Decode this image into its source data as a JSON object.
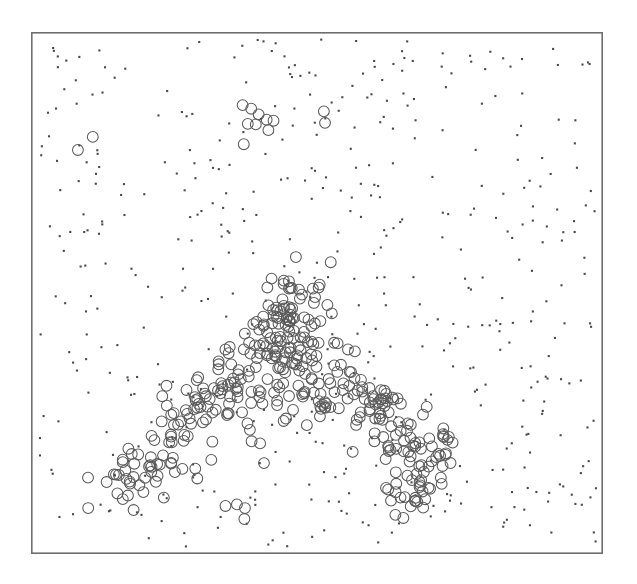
{
  "figure": {
    "background_color": "#ffffff",
    "width": 637,
    "height": 584
  },
  "plot": {
    "frame": {
      "left": 31,
      "top": 32,
      "width": 572,
      "height": 522,
      "stroke_color": "#6e6e6e",
      "stroke_width": 1.6
    },
    "title": "",
    "xlabel": "",
    "ylabel": "",
    "x_tick_labels": [],
    "y_tick_labels": [],
    "legend": null,
    "grid": false
  },
  "chart_data": {
    "type": "scatter",
    "title": "",
    "subtitle": "",
    "xlabel": "",
    "ylabel": "",
    "grid": false,
    "legend_position": "none",
    "xlim": [
      0,
      1
    ],
    "ylim": [
      0,
      1
    ],
    "axis_ticks_visible": false,
    "tick_labels_visible": false,
    "series": [
      {
        "name": "noise",
        "marker": "filled-dot",
        "marker_size_px": 2.1,
        "color": "#4a4a4a",
        "count": 520,
        "distribution": "uniform-random over full panel",
        "seed": 20240517
      },
      {
        "name": "cluster",
        "marker": "open-circle",
        "marker_radius_px": 5.4,
        "stroke_color": "#5a5a5a",
        "stroke_width_px": 1.05,
        "count": 430,
        "distribution": "triangular ridge / mountain-shaped band in lower-centre plus sparse outliers",
        "seed": 987654,
        "ridge_nodes": [
          {
            "x": 0.455,
            "y": 0.515,
            "spread_x": 0.045,
            "spread_y": 0.045,
            "weight": 0.1
          },
          {
            "x": 0.43,
            "y": 0.58,
            "spread_x": 0.055,
            "spread_y": 0.05,
            "weight": 0.12
          },
          {
            "x": 0.48,
            "y": 0.635,
            "spread_x": 0.06,
            "spread_y": 0.05,
            "weight": 0.12
          },
          {
            "x": 0.37,
            "y": 0.65,
            "spread_x": 0.05,
            "spread_y": 0.045,
            "weight": 0.1
          },
          {
            "x": 0.3,
            "y": 0.715,
            "spread_x": 0.055,
            "spread_y": 0.045,
            "weight": 0.11
          },
          {
            "x": 0.225,
            "y": 0.79,
            "spread_x": 0.055,
            "spread_y": 0.045,
            "weight": 0.1
          },
          {
            "x": 0.165,
            "y": 0.87,
            "spread_x": 0.05,
            "spread_y": 0.045,
            "weight": 0.09
          },
          {
            "x": 0.565,
            "y": 0.68,
            "spread_x": 0.055,
            "spread_y": 0.05,
            "weight": 0.11
          },
          {
            "x": 0.64,
            "y": 0.745,
            "spread_x": 0.05,
            "spread_y": 0.05,
            "weight": 0.1
          },
          {
            "x": 0.705,
            "y": 0.815,
            "spread_x": 0.045,
            "spread_y": 0.045,
            "weight": 0.08
          },
          {
            "x": 0.66,
            "y": 0.885,
            "spread_x": 0.035,
            "spread_y": 0.03,
            "weight": 0.05
          }
        ],
        "outliers": [
          {
            "x": 0.108,
            "y": 0.201
          },
          {
            "x": 0.082,
            "y": 0.226
          },
          {
            "x": 0.37,
            "y": 0.14
          },
          {
            "x": 0.385,
            "y": 0.147
          },
          {
            "x": 0.398,
            "y": 0.158
          },
          {
            "x": 0.379,
            "y": 0.176
          },
          {
            "x": 0.393,
            "y": 0.177
          },
          {
            "x": 0.412,
            "y": 0.168
          },
          {
            "x": 0.424,
            "y": 0.17
          },
          {
            "x": 0.415,
            "y": 0.188
          },
          {
            "x": 0.372,
            "y": 0.215
          },
          {
            "x": 0.512,
            "y": 0.152
          },
          {
            "x": 0.514,
            "y": 0.174
          },
          {
            "x": 0.524,
            "y": 0.441
          },
          {
            "x": 0.34,
            "y": 0.908
          },
          {
            "x": 0.36,
            "y": 0.905
          },
          {
            "x": 0.374,
            "y": 0.912
          },
          {
            "x": 0.373,
            "y": 0.933
          },
          {
            "x": 0.637,
            "y": 0.925
          },
          {
            "x": 0.651,
            "y": 0.931
          },
          {
            "x": 0.1,
            "y": 0.912
          },
          {
            "x": 0.62,
            "y": 0.818
          }
        ]
      }
    ]
  }
}
